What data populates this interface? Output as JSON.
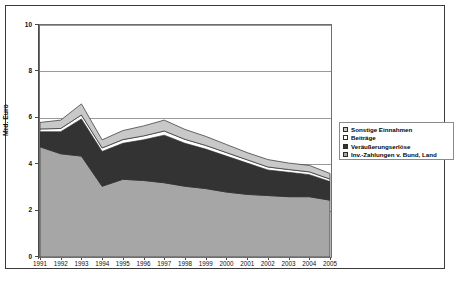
{
  "chart_data": {
    "type": "area",
    "stacked": true,
    "title": "",
    "xlabel": "",
    "ylabel": "Mrd. Euro",
    "categories": [
      "1991",
      "1992",
      "1993",
      "1994",
      "1995",
      "1996",
      "1997",
      "1998",
      "1999",
      "2000",
      "2001",
      "2002",
      "2003",
      "2004",
      "2005"
    ],
    "ylim": [
      0,
      10
    ],
    "yticks": [
      0,
      2,
      4,
      6,
      8,
      10
    ],
    "grid": true,
    "legend_position": "right",
    "series": [
      {
        "name": "Inv.-Zahlungen v. Bund, Land",
        "color": "#a6a6a6",
        "values": [
          4.75,
          4.45,
          4.35,
          3.05,
          3.35,
          3.3,
          3.2,
          3.05,
          2.95,
          2.8,
          2.7,
          2.65,
          2.6,
          2.6,
          2.45
        ]
      },
      {
        "name": "Veräußerungserlöse",
        "color": "#333333",
        "values": [
          0.65,
          0.95,
          1.6,
          1.5,
          1.55,
          1.75,
          2.05,
          1.85,
          1.7,
          1.55,
          1.35,
          1.1,
          1.05,
          0.95,
          0.8
        ]
      },
      {
        "name": "Beiträge",
        "color": "#ffffff",
        "values": [
          0.12,
          0.14,
          0.17,
          0.15,
          0.16,
          0.17,
          0.18,
          0.17,
          0.16,
          0.15,
          0.14,
          0.13,
          0.12,
          0.12,
          0.11
        ]
      },
      {
        "name": "Sonstige Einnahmen",
        "color": "#c8c8c8",
        "values": [
          0.28,
          0.36,
          0.48,
          0.35,
          0.39,
          0.43,
          0.47,
          0.43,
          0.39,
          0.35,
          0.31,
          0.32,
          0.28,
          0.28,
          0.24
        ]
      }
    ]
  },
  "legend": {
    "items": [
      {
        "label": "Sonstige Einnahmen",
        "color": "#c8c8c8"
      },
      {
        "label": "Beiträge",
        "color": "#ffffff"
      },
      {
        "label": "Veräußerungserlöse",
        "color": "#333333"
      },
      {
        "label": "Inv.-Zahlungen v. Bund, Land",
        "color": "#a6a6a6"
      }
    ]
  }
}
